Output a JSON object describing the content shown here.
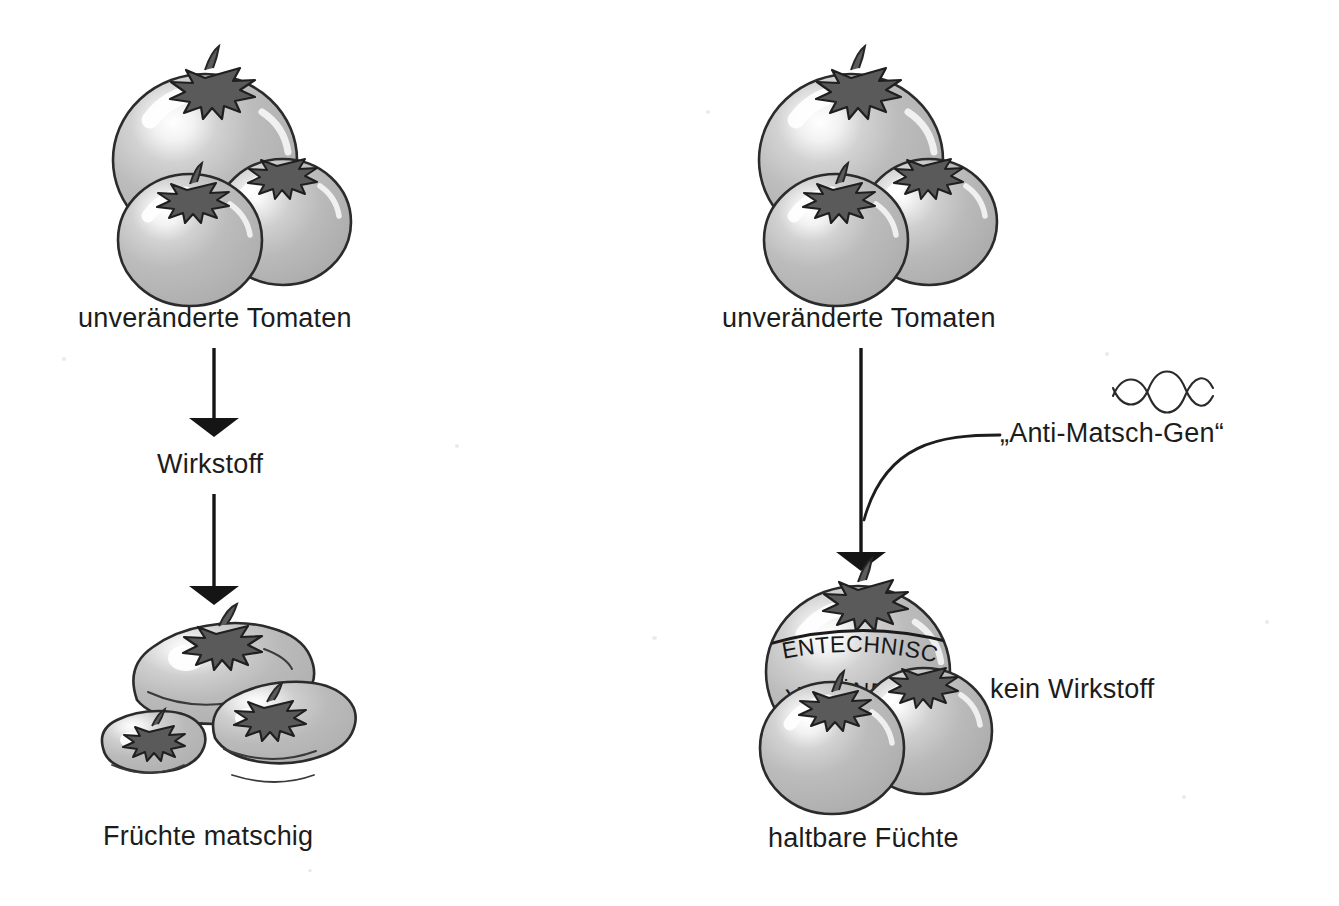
{
  "diagram": {
    "language": "de",
    "background_color": "#ffffff",
    "ink_color": "#1c1c1c",
    "tomato_fill": "#b4b4b4",
    "tomato_outline": "#2b2b2b",
    "highlight_color": "#ffffff",
    "calyx_color": "#555555"
  },
  "left_branch": {
    "source_label": "unveränderte Tomaten",
    "process_label": "Wirkstoff",
    "result_label": "Früchte matschig",
    "arrow_top": "arrow-down-icon",
    "arrow_bottom": "arrow-down-icon"
  },
  "right_branch": {
    "source_label": "unveränderte Tomaten",
    "gene_label": "„Anti-Matsch-Gen“",
    "gene_icon": "dna-helix-icon",
    "side_label": "kein Wirkstoff",
    "result_label": "haltbare Füchte",
    "arrow_main": "arrow-down-icon",
    "gene_connector": "curved-connector-line",
    "banner_line_1": "GENTECHNISCH",
    "banner_line_2": "VERÄNDERT"
  }
}
